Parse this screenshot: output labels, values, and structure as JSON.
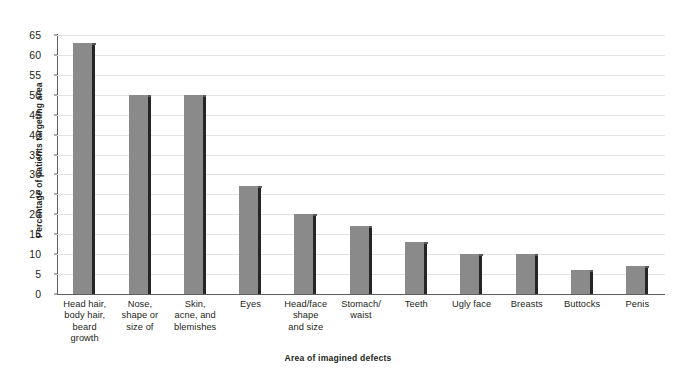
{
  "chart_data": {
    "type": "bar",
    "title": "",
    "xlabel": "Area of imagined defects",
    "ylabel": "Percentage of patients targeting area",
    "categories": [
      "Head hair,\nbody hair,\nbeard\ngrowth",
      "Nose,\nshape or\nsize of",
      "Skin,\nacne, and\nblemishes",
      "Eyes",
      "Head/face\nshape\nand size",
      "Stomach/\nwaist",
      "Teeth",
      "Ugly face",
      "Breasts",
      "Buttocks",
      "Penis"
    ],
    "values": [
      63,
      50,
      50,
      27,
      20,
      17,
      13,
      10,
      10,
      6,
      7
    ],
    "ylim": [
      0,
      65
    ],
    "ytick_step": 5,
    "yticks": [
      0,
      5,
      10,
      15,
      20,
      25,
      30,
      35,
      40,
      45,
      50,
      55,
      60,
      65
    ],
    "grid": true,
    "legend": "none",
    "bar_color": "#8a8a8a",
    "bar_edge_color": "#252525",
    "gridline_color": "#e3e3e3",
    "axis_color": "#5e5e5e",
    "text_color": "#231f20"
  }
}
